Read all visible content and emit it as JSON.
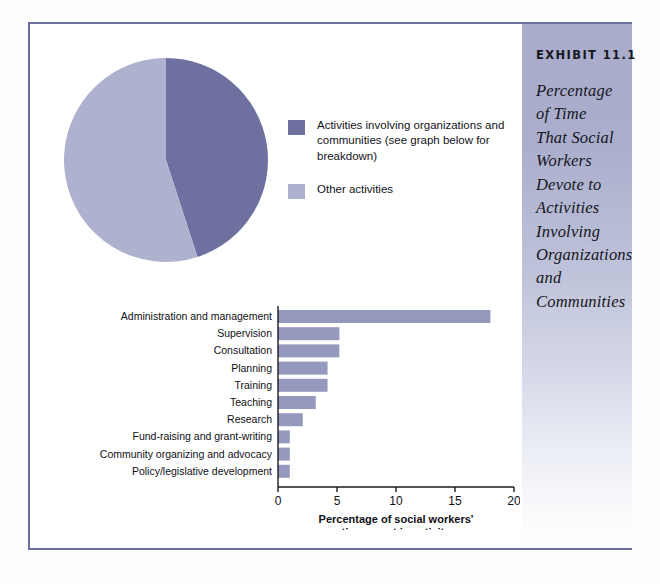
{
  "exhibit": {
    "kicker": "EXHIBIT 11.1",
    "title": "Percentage of Time That Social Workers Devote to Activities Involving Organizations and Communities"
  },
  "colors": {
    "dark_slice": "#6e71a0",
    "light_slice": "#afb2ce",
    "bar": "#9699be",
    "frame": "#6b6e9e",
    "axis": "#1a1a22",
    "panel_top": "#a9accb"
  },
  "legend": {
    "items": [
      {
        "swatch": "#6e71a0",
        "label": "Activities involving organizations and communities (see graph below for  breakdown)"
      },
      {
        "swatch": "#afb2ce",
        "label": "Other activities"
      }
    ]
  },
  "chart_data": [
    {
      "type": "pie",
      "title": "",
      "legend_position": "right",
      "labels": [
        "Activities involving organizations and communities (see graph below for  breakdown)",
        "Other activities"
      ],
      "values": [
        45,
        55
      ],
      "colors": [
        "#6e71a0",
        "#afb2ce"
      ]
    },
    {
      "type": "bar",
      "orientation": "horizontal",
      "title": "",
      "xlabel": "Percentage of social workers' time spent in activity",
      "ylabel": "",
      "xlim": [
        0,
        20
      ],
      "xticks": [
        0,
        5,
        10,
        15,
        20
      ],
      "xtick_labels": [
        "0",
        "5",
        "10",
        "15",
        "20"
      ],
      "grid": false,
      "bar_color": "#9699be",
      "categories": [
        "Administration and management",
        "Supervision",
        "Consultation",
        "Planning",
        "Training",
        "Teaching",
        "Research",
        "Fund-raising and grant-writing",
        "Community organizing and advocacy",
        "Policy/legislative development"
      ],
      "values": [
        18,
        5.2,
        5.2,
        4.2,
        4.2,
        3.2,
        2.1,
        1,
        1,
        1
      ]
    }
  ]
}
